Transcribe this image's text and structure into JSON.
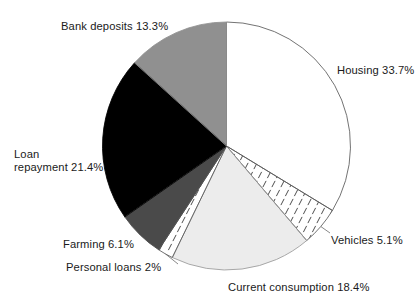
{
  "chart_data": {
    "type": "pie",
    "title": "",
    "xlabel": "",
    "ylabel": "",
    "unit": "%",
    "start_angle_deg": 0,
    "direction": "clockwise",
    "legend": "none (labels placed around pie)",
    "grid": false,
    "categories": [
      "Housing",
      "Vehicles",
      "Current consumption",
      "Personal loans",
      "Farming",
      "Loan repayment",
      "Bank deposits"
    ],
    "values": [
      33.7,
      5.1,
      18.4,
      2,
      6.1,
      21.4,
      13.3
    ],
    "total": 100.0,
    "slices": [
      {
        "name": "Housing",
        "value": 33.7,
        "value_text": "33.7%",
        "label": "Housing 33.7%",
        "fill": "#ffffff",
        "fill_style": "solid",
        "stroke": "#5a5a5a"
      },
      {
        "name": "Vehicles",
        "value": 5.1,
        "value_text": "5.1%",
        "label": "Vehicles 5.1%",
        "fill": "#ffffff",
        "fill_style": "sparse-diagonal-ticks",
        "stroke": "#5a5a5a"
      },
      {
        "name": "Current consumption",
        "value": 18.4,
        "value_text": "18.4%",
        "label": "Current consumption 18.4%",
        "fill": "#ececec",
        "fill_style": "solid",
        "stroke": "#9a9a9a"
      },
      {
        "name": "Personal loans",
        "value": 2,
        "value_text": "2%",
        "label": "Personal loans 2%",
        "fill": "#ffffff",
        "fill_style": "sparse-diagonal-ticks",
        "stroke": "#5a5a5a"
      },
      {
        "name": "Farming",
        "value": 6.1,
        "value_text": "6.1%",
        "label": "Farming 6.1%",
        "fill": "#4a4a4a",
        "fill_style": "solid",
        "stroke": "#4a4a4a"
      },
      {
        "name": "Loan repayment",
        "value": 21.4,
        "value_text": "21.4%",
        "label": "Loan repayment 21.4%",
        "fill": "#000000",
        "fill_style": "solid",
        "stroke": "#000000"
      },
      {
        "name": "Bank deposits",
        "value": 13.3,
        "value_text": "13.3%",
        "label": "Bank deposits 13.3%",
        "fill": "#909090",
        "fill_style": "solid",
        "stroke": "#909090"
      }
    ]
  },
  "labels": {
    "bank_deposits": "Bank deposits 13.3%",
    "housing": "Housing 33.7%",
    "loan_repayment_line1": "Loan",
    "loan_repayment_line2": "repayment 21.4%",
    "farming": "Farming 6.1%",
    "personal_loans": "Personal loans 2%",
    "current_consumption": "Current consumption 18.4%",
    "vehicles": "Vehicles 5.1%"
  }
}
